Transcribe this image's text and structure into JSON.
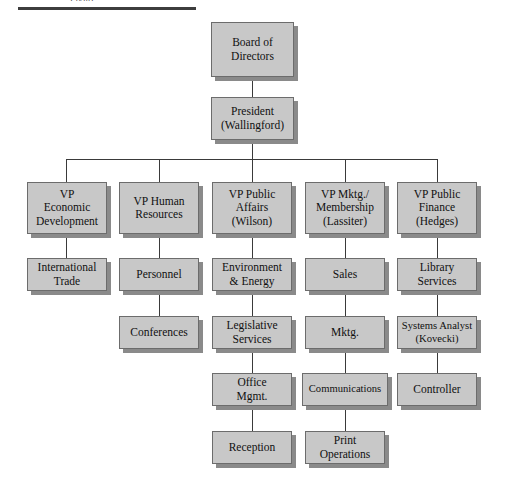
{
  "document": {
    "caption_clipped": "Figure",
    "title": "Organization Chart"
  },
  "chart": {
    "type": "org-chart",
    "box_fill_color": "#c8c8c8",
    "box_border_color": "#6c6c6c",
    "box_shadow_color": "#8a8a8a",
    "connector_color": "#3a3a3a",
    "background_color": "#ffffff",
    "rule_color": "#3d3d3d"
  },
  "nodes": {
    "board": "Board of\nDirectors",
    "president": "President\n(Wallingford)",
    "vp_econ": "VP\nEconomic\nDevelopment",
    "vp_hr": "VP Human\nResources",
    "vp_public_affairs": "VP Public\nAffairs\n(Wilson)",
    "vp_mktg": "VP Mktg./\nMembership\n(Lassiter)",
    "vp_finance": "VP Public\nFinance\n(Hedges)",
    "international_trade": "International\nTrade",
    "personnel": "Personnel",
    "environment_energy": "Environment\n& Energy",
    "sales": "Sales",
    "library_services": "Library\nServices",
    "conferences": "Conferences",
    "legislative_services": "Legislative\nServices",
    "mktg": "Mktg.",
    "systems_analyst": "Systems Analyst\n(Kovecki)",
    "office_mgmt": "Office\nMgmt.",
    "communications": "Communications",
    "controller": "Controller",
    "reception": "Reception",
    "print_operations": "Print\nOperations"
  }
}
